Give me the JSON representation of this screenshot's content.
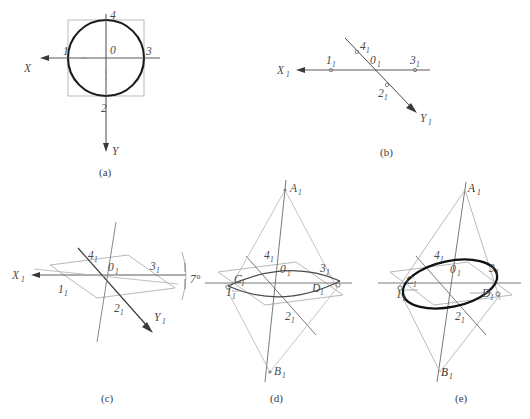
{
  "figure": {
    "colors": {
      "bold_curve": "#1a1a1a",
      "axis_line": "#5a5a5a",
      "construction_line": "#9a9a9a",
      "light_construction": "#b4b4b4",
      "label_text": "#4a4a4a",
      "caption_text": "#3b3b3b",
      "background": "#ffffff"
    },
    "panels": [
      {
        "id": "a",
        "caption": "(a)",
        "description": "Circle inscribed in square with orthographic X and Y axes",
        "axis_labels": [
          "X",
          "Y"
        ],
        "point_labels": [
          "1",
          "2",
          "3",
          "4",
          "0"
        ]
      },
      {
        "id": "b",
        "caption": "(b)",
        "description": "Isometric axes X1 and Y1 with projected points",
        "axis_labels": [
          "X₁",
          "Y₁"
        ],
        "point_labels": [
          "1₁",
          "2₁",
          "3₁",
          "4₁",
          "0₁"
        ]
      },
      {
        "id": "c",
        "caption": "(c)",
        "description": "Isometric plane parallelogram drawn through the axes at 7 degrees",
        "axis_labels": [
          "X₁",
          "Y₁"
        ],
        "point_labels": [
          "1₁",
          "2₁",
          "3₁",
          "4₁",
          "0₁"
        ],
        "angle_annotation": "7°"
      },
      {
        "id": "d",
        "caption": "(d)",
        "description": "Four-center arc construction with centers A1, B1, C1, D1",
        "axis_labels": [],
        "point_labels": [
          "1₁",
          "2₁",
          "3₁",
          "4₁",
          "0₁",
          "A₁",
          "B₁",
          "C₁",
          "D₁"
        ]
      },
      {
        "id": "e",
        "caption": "(e)",
        "description": "Completed isometric ellipse traced in bold",
        "axis_labels": [],
        "point_labels": [
          "1₁",
          "2₁",
          "3₁",
          "4₁",
          "0₁",
          "A₁",
          "B₁",
          "C₁",
          "D₁"
        ]
      }
    ],
    "labels": {
      "x": "X",
      "y": "Y",
      "x1_main": "X",
      "y1_main": "Y",
      "sub1": "1",
      "p0": "0",
      "p1": "1",
      "p2": "2",
      "p3": "3",
      "p4": "4",
      "pA": "A",
      "pB": "B",
      "pC": "C",
      "pD": "D",
      "angle7": "7°"
    },
    "captions": {
      "a": "(a)",
      "b": "(b)",
      "c": "(c)",
      "d": "(d)",
      "e": "(e)"
    }
  }
}
